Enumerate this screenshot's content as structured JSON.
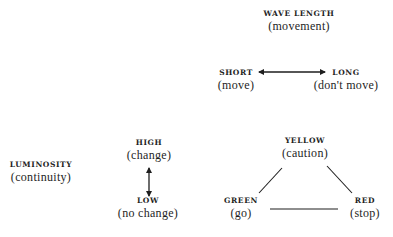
{
  "diagram": {
    "wavelength": {
      "label": "WAVE LENGTH",
      "meaning": "(movement)",
      "short": {
        "label": "SHORT",
        "meaning": "(move)"
      },
      "long": {
        "label": "LONG",
        "meaning": "(don't move)"
      },
      "connector": "double-headed-horizontal-arrow"
    },
    "luminosity": {
      "label": "LUMINOSITY",
      "meaning": "(continuity)",
      "high": {
        "label": "HIGH",
        "meaning": "(change)"
      },
      "low": {
        "label": "LOW",
        "meaning": "(no change)"
      },
      "connector": "double-headed-vertical-arrow"
    },
    "traffic_triangle": {
      "yellow": {
        "label": "YELLOW",
        "meaning": "(caution)"
      },
      "green": {
        "label": "GREEN",
        "meaning": "(go)"
      },
      "red": {
        "label": "RED",
        "meaning": "(stop)"
      },
      "connectors": [
        "yellow-green",
        "yellow-red",
        "green-red"
      ]
    }
  },
  "colors": {
    "ink": "#1e1e1e",
    "background": "#ffffff"
  }
}
